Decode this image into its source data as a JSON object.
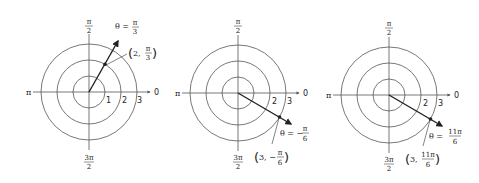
{
  "diagrams": [
    {
      "id": "polar-1",
      "axis_labels": {
        "top_num": "π",
        "top_den": "2",
        "left": "π",
        "right": "0",
        "bottom_num": "3π",
        "bottom_den": "2"
      },
      "ring_labels": [
        "1",
        "2",
        "3"
      ],
      "theta_label": {
        "prefix": "θ =",
        "num": "π",
        "den": "3"
      },
      "point_label": {
        "open": "(",
        "r": "2,",
        "num": "π",
        "den": "3",
        "close": ")"
      }
    },
    {
      "id": "polar-2",
      "axis_labels": {
        "top_num": "π",
        "top_den": "2",
        "left": "π",
        "right": "0",
        "bottom_num": "3π",
        "bottom_den": "2"
      },
      "ring_labels": [
        "2",
        "3"
      ],
      "theta_label": {
        "prefix": "θ = −",
        "num": "π",
        "den": "6"
      },
      "point_label": {
        "open": "(",
        "r": "3, −",
        "num": "π",
        "den": "6",
        "close": ")"
      }
    },
    {
      "id": "polar-3",
      "axis_labels": {
        "top_num": "π",
        "top_den": "2",
        "left": "π",
        "right": "0",
        "bottom_num": "3π",
        "bottom_den": "2"
      },
      "ring_labels": [
        "2",
        "3"
      ],
      "theta_label": {
        "prefix": "θ =",
        "num": "11π",
        "den": "6"
      },
      "point_label": {
        "open": "(",
        "r": "3,",
        "num": "11π",
        "den": "6",
        "close": ")"
      }
    }
  ],
  "colors": {
    "line": "#555555",
    "ray": "#222222",
    "text": "#222222"
  }
}
